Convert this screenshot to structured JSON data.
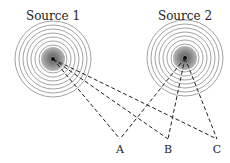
{
  "diagram": {
    "sources": [
      {
        "id": "s1",
        "label": "Source 1",
        "x": 53,
        "y": 59
      },
      {
        "id": "s2",
        "label": "Source 2",
        "x": 185,
        "y": 58
      }
    ],
    "points": [
      {
        "id": "A",
        "label": "A",
        "x": 120,
        "y": 139
      },
      {
        "id": "B",
        "label": "B",
        "x": 168,
        "y": 139
      },
      {
        "id": "C",
        "label": "C",
        "x": 217,
        "y": 139
      }
    ],
    "ring_radii": [
      14,
      18,
      22,
      26,
      30,
      34,
      38
    ],
    "colors": {
      "ring": "#8a8a8a",
      "core": "#9a9a9a",
      "line": "#222222"
    }
  }
}
